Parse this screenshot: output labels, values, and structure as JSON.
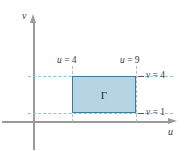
{
  "figure": {
    "axes": {
      "horizontal_label": "u",
      "vertical_label": "v"
    },
    "region": {
      "name": "Γ",
      "u_min_label": "u = 4",
      "u_max_label": "u = 9",
      "v_min_label": "v = 1",
      "v_max_label": "v = 4",
      "fill_color": "#b6d5e3",
      "border_color": "#3b7e9b"
    },
    "guide_color": "#8fc2d8",
    "axis_color": "#9a9a9a"
  },
  "chart_data": {
    "type": "area",
    "title": "",
    "xlabel": "u",
    "ylabel": "v",
    "grid": false,
    "legend": "none",
    "annotations": [
      "u = 4",
      "u = 9",
      "v = 4",
      "v = 1",
      "Γ"
    ],
    "shapes": [
      {
        "kind": "rectangle",
        "label": "Γ",
        "u": [
          4,
          9
        ],
        "v": [
          1,
          4
        ],
        "fill": "#b6d5e3",
        "stroke": "#3b7e9b"
      }
    ],
    "x": [
      4,
      9
    ],
    "values": [
      1,
      4
    ],
    "xlim": [
      0,
      11
    ],
    "ylim": [
      0,
      5.5
    ]
  }
}
